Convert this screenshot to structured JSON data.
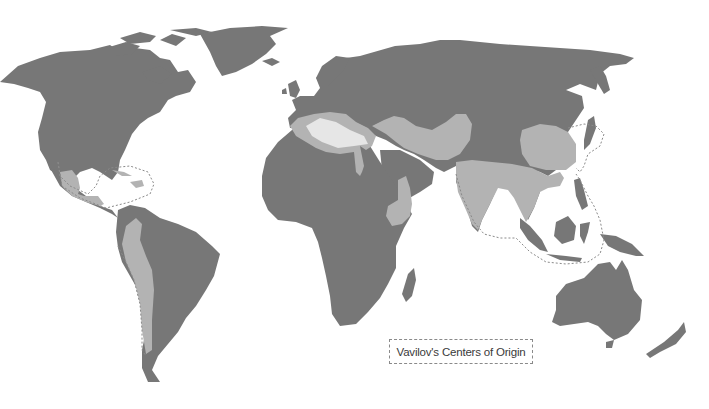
{
  "map": {
    "title": "Vavilov's Centers of Origin",
    "colors": {
      "land": "#777777",
      "center": "#b3b3b3",
      "water": "#ffffff",
      "dashed_outline": "#8a8a8a"
    },
    "centers": [
      {
        "id": "mexico-central-america",
        "region": "Mexico and Central America, Caribbean"
      },
      {
        "id": "andes",
        "region": "Western South America (Andes)"
      },
      {
        "id": "mediterranean",
        "region": "Mediterranean"
      },
      {
        "id": "near-east-central-asia",
        "region": "Near East / Central Asia"
      },
      {
        "id": "ethiopia",
        "region": "Ethiopia"
      },
      {
        "id": "china",
        "region": "China"
      },
      {
        "id": "south-southeast-asia",
        "region": "India and Southeast Asia"
      }
    ]
  }
}
